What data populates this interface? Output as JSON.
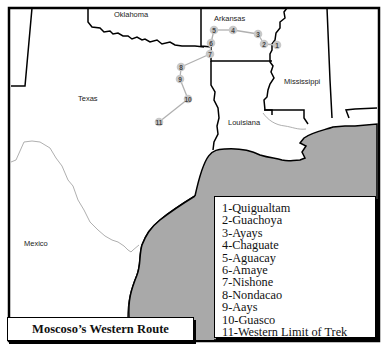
{
  "map": {
    "title": "Moscoso’s Western Route",
    "colors": {
      "land": "#ffffff",
      "gulf": "#a9a9a9",
      "border": "#111111",
      "river": "#9a9a9a",
      "route": "#b0b0b0",
      "marker": "#c8c8c8"
    },
    "region_labels": [
      {
        "id": "oklahoma",
        "label": "Oklahoma"
      },
      {
        "id": "arkansas",
        "label": "Arkansas"
      },
      {
        "id": "mississippi",
        "label": "Mississippi"
      },
      {
        "id": "texas",
        "label": "Texas"
      },
      {
        "id": "louisiana",
        "label": "Louisiana"
      },
      {
        "id": "mexico",
        "label": "Mexico"
      }
    ],
    "route_markers": [
      {
        "num": "1"
      },
      {
        "num": "2"
      },
      {
        "num": "3"
      },
      {
        "num": "4"
      },
      {
        "num": "5"
      },
      {
        "num": "6"
      },
      {
        "num": "7"
      },
      {
        "num": "8"
      },
      {
        "num": "9"
      },
      {
        "num": "10"
      },
      {
        "num": "11"
      }
    ],
    "legend": [
      "1-Quigualtam",
      "2-Guachoya",
      "3-Ayays",
      "4-Chaguate",
      "5-Aguacay",
      "6-Amaye",
      "7-Nishone",
      "8-Nondacao",
      "9-Aays",
      "10-Guasco",
      "11-Western Limit of Trek"
    ]
  }
}
